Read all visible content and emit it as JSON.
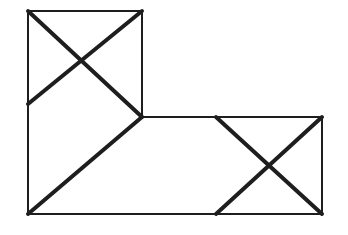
{
  "diagram": {
    "colors": {
      "stroke": "#1e1e1e",
      "background": "#ffffff"
    },
    "outline_points": [
      [
        28,
        11
      ],
      [
        142,
        11
      ],
      [
        142,
        117
      ],
      [
        322,
        117
      ],
      [
        322,
        214
      ],
      [
        28,
        214
      ]
    ],
    "inner_lines": [
      {
        "name": "upper-box-bottom-edge",
        "from": [
          28,
          104
        ],
        "to": [
          142,
          117
        ],
        "weight": "none"
      },
      {
        "name": "right-box-left-edge",
        "from": [
          216,
          117
        ],
        "to": [
          216,
          214
        ],
        "weight": "none"
      }
    ],
    "thick_lines": [
      {
        "name": "upper-box-diagonal-down",
        "from": [
          28,
          11
        ],
        "to": [
          142,
          117
        ]
      },
      {
        "name": "upper-box-diagonal-up",
        "from": [
          142,
          11
        ],
        "to": [
          28,
          104
        ]
      },
      {
        "name": "middle-brace-diagonal",
        "from": [
          142,
          117
        ],
        "to": [
          28,
          214
        ]
      },
      {
        "name": "right-box-diagonal-down",
        "from": [
          216,
          117
        ],
        "to": [
          322,
          214
        ]
      },
      {
        "name": "right-box-diagonal-up",
        "from": [
          322,
          117
        ],
        "to": [
          216,
          214
        ]
      }
    ]
  }
}
